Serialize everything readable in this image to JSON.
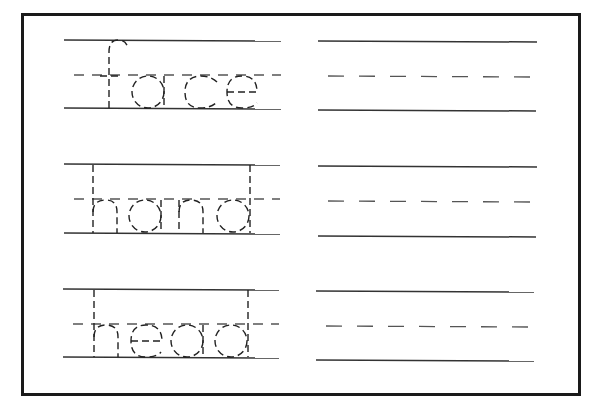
{
  "worksheet": {
    "title": "Handwriting tracing worksheet",
    "words": [
      {
        "text": "face"
      },
      {
        "text": "hand"
      },
      {
        "text": "head"
      }
    ],
    "colors": {
      "frame": "#1a1a1a",
      "line": "#333333",
      "dashed_line": "#555555",
      "trace_letters": "#222222",
      "background": "#ffffff"
    }
  }
}
